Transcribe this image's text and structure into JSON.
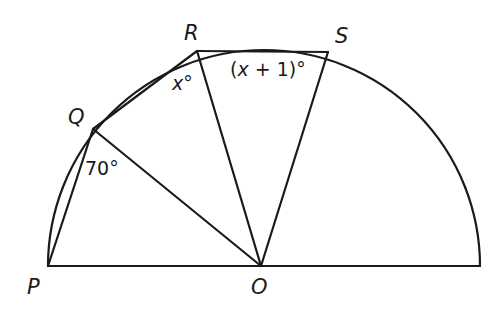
{
  "diagram": {
    "type": "semicircle-geometry",
    "points": {
      "P": {
        "label": "P",
        "x": 48,
        "y": 266
      },
      "O": {
        "label": "O",
        "x": 261,
        "y": 266
      },
      "E": {
        "label": "",
        "x": 480,
        "y": 266
      },
      "Q": {
        "label": "Q",
        "x": 93,
        "y": 129
      },
      "R": {
        "label": "R",
        "x": 197,
        "y": 51
      },
      "S": {
        "label": "S",
        "x": 328,
        "y": 52
      }
    },
    "segments": [
      "PE",
      "PQ",
      "QR",
      "RS",
      "QO",
      "RO",
      "SO"
    ],
    "arc": {
      "from": "P",
      "to": "E",
      "center": "O",
      "radius": 216
    },
    "angles": {
      "PQO": {
        "text_num": "70",
        "degree": "°"
      },
      "QRO": {
        "text_var": "x",
        "degree": "°"
      },
      "RSO": {
        "open": "(",
        "var": "x",
        "rest": " + 1)",
        "degree": "°"
      }
    }
  }
}
